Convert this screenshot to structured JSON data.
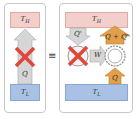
{
  "diagram": {
    "left_panel": {
      "hot_reservoir": "T_H",
      "cold_reservoir": "T_L",
      "heat_flow_label": "Q",
      "forbidden_mark": "X"
    },
    "equivalence_symbol": "≡",
    "right_panel": {
      "hot_reservoir": "T_H",
      "cold_reservoir": "T_L",
      "engine_heat_in": "Q'",
      "work_label": "W",
      "pump_heat_out": "Q + Q'",
      "pump_heat_in": "Q",
      "forbidden_mark": "X"
    },
    "colors": {
      "hot": "#f2cfca",
      "cold": "#a9c1e4",
      "arrow_gray": "#d6d6d6",
      "arrow_orange": "#e3a04a",
      "cross_red": "#e0463a"
    }
  }
}
